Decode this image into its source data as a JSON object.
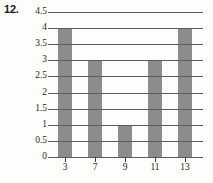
{
  "problem": {
    "number": "12."
  },
  "chart_data": {
    "type": "bar",
    "title": "",
    "xlabel": "",
    "ylabel": "",
    "categories": [
      "3",
      "7",
      "9",
      "11",
      "13"
    ],
    "values": [
      4,
      3,
      1,
      3,
      4
    ],
    "ylim": [
      0,
      4.5
    ],
    "ytick_labels": [
      "4.5",
      "4",
      "3.5",
      "3",
      "2.5",
      "2",
      "1.5",
      "1",
      "0.5",
      "0"
    ],
    "ytick_values": [
      4.5,
      4,
      3.5,
      3,
      2.5,
      2,
      1.5,
      1,
      0.5,
      0
    ],
    "grid": true,
    "grid_axis": "y",
    "legend": null,
    "bar_color": "#8c8c8c",
    "grid_color": "#5c5c5c",
    "background_color": "#fdfdfc"
  }
}
